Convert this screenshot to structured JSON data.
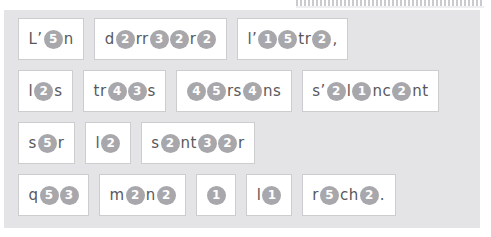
{
  "exercise": {
    "type": "fill-in-the-blank-cloze",
    "blank_style": "numbered-circle",
    "colors": {
      "panel_background": "#e4e4e6",
      "box_background": "#ffffff",
      "box_border": "#cdcdd0",
      "blank_circle": "#a8a8ac",
      "blank_digit": "#ffffff",
      "text": "#58585c"
    },
    "rows": [
      {
        "words": [
          {
            "tokens": [
              {
                "t": "text",
                "v": "L’"
              },
              {
                "t": "blank",
                "v": "5"
              },
              {
                "t": "text",
                "v": "n"
              }
            ]
          },
          {
            "tokens": [
              {
                "t": "text",
                "v": "d"
              },
              {
                "t": "blank",
                "v": "2"
              },
              {
                "t": "text",
                "v": "rr"
              },
              {
                "t": "blank",
                "v": "3"
              },
              {
                "t": "blank",
                "v": "2"
              },
              {
                "t": "text",
                "v": "r"
              },
              {
                "t": "blank",
                "v": "2"
              }
            ]
          },
          {
            "tokens": [
              {
                "t": "text",
                "v": "l’"
              },
              {
                "t": "blank",
                "v": "1"
              },
              {
                "t": "blank",
                "v": "5"
              },
              {
                "t": "text",
                "v": "tr"
              },
              {
                "t": "blank",
                "v": "2"
              },
              {
                "t": "text",
                "v": ","
              }
            ]
          }
        ]
      },
      {
        "words": [
          {
            "tokens": [
              {
                "t": "text",
                "v": "l"
              },
              {
                "t": "blank",
                "v": "2"
              },
              {
                "t": "text",
                "v": "s"
              }
            ]
          },
          {
            "tokens": [
              {
                "t": "text",
                "v": "tr"
              },
              {
                "t": "blank",
                "v": "4"
              },
              {
                "t": "blank",
                "v": "3"
              },
              {
                "t": "text",
                "v": "s"
              }
            ]
          },
          {
            "tokens": [
              {
                "t": "blank",
                "v": "4"
              },
              {
                "t": "blank",
                "v": "5"
              },
              {
                "t": "text",
                "v": "rs"
              },
              {
                "t": "blank",
                "v": "4"
              },
              {
                "t": "text",
                "v": "ns"
              }
            ]
          },
          {
            "tokens": [
              {
                "t": "text",
                "v": "s’"
              },
              {
                "t": "blank",
                "v": "2"
              },
              {
                "t": "text",
                "v": "l"
              },
              {
                "t": "blank",
                "v": "1"
              },
              {
                "t": "text",
                "v": "nc"
              },
              {
                "t": "blank",
                "v": "2"
              },
              {
                "t": "text",
                "v": "nt"
              }
            ]
          }
        ]
      },
      {
        "words": [
          {
            "tokens": [
              {
                "t": "text",
                "v": "s"
              },
              {
                "t": "blank",
                "v": "5"
              },
              {
                "t": "text",
                "v": "r"
              }
            ]
          },
          {
            "tokens": [
              {
                "t": "text",
                "v": "l"
              },
              {
                "t": "blank",
                "v": "2"
              }
            ]
          },
          {
            "tokens": [
              {
                "t": "text",
                "v": "s"
              },
              {
                "t": "blank",
                "v": "2"
              },
              {
                "t": "text",
                "v": "nt"
              },
              {
                "t": "blank",
                "v": "3"
              },
              {
                "t": "blank",
                "v": "2"
              },
              {
                "t": "text",
                "v": "r"
              }
            ]
          }
        ]
      },
      {
        "words": [
          {
            "tokens": [
              {
                "t": "text",
                "v": "q"
              },
              {
                "t": "blank",
                "v": "5"
              },
              {
                "t": "blank",
                "v": "3"
              }
            ]
          },
          {
            "tokens": [
              {
                "t": "text",
                "v": "m"
              },
              {
                "t": "blank",
                "v": "2"
              },
              {
                "t": "text",
                "v": "n"
              },
              {
                "t": "blank",
                "v": "2"
              }
            ]
          },
          {
            "tokens": [
              {
                "t": "blank",
                "v": "1"
              }
            ]
          },
          {
            "tokens": [
              {
                "t": "text",
                "v": "l"
              },
              {
                "t": "blank",
                "v": "1"
              }
            ]
          },
          {
            "tokens": [
              {
                "t": "text",
                "v": "r"
              },
              {
                "t": "blank",
                "v": "5"
              },
              {
                "t": "text",
                "v": "ch"
              },
              {
                "t": "blank",
                "v": "2"
              },
              {
                "t": "text",
                "v": "."
              }
            ]
          }
        ]
      }
    ]
  }
}
